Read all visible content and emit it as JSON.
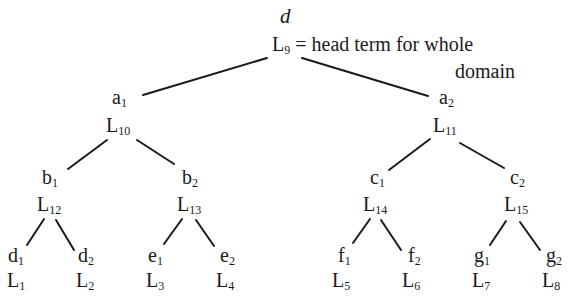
{
  "diagram": {
    "type": "tree",
    "root": {
      "variable": "d",
      "term": "L",
      "term_sub": "9",
      "annotation_line1": "= head term for whole",
      "annotation_line2": "domain"
    },
    "level1": [
      {
        "var": "a",
        "var_sub": "1",
        "term": "L",
        "term_sub": "10"
      },
      {
        "var": "a",
        "var_sub": "2",
        "term": "L",
        "term_sub": "11"
      }
    ],
    "level2": [
      {
        "var": "b",
        "var_sub": "1",
        "term": "L",
        "term_sub": "12"
      },
      {
        "var": "b",
        "var_sub": "2",
        "term": "L",
        "term_sub": "13"
      },
      {
        "var": "c",
        "var_sub": "1",
        "term": "L",
        "term_sub": "14"
      },
      {
        "var": "c",
        "var_sub": "2",
        "term": "L",
        "term_sub": "15"
      }
    ],
    "leaves": [
      {
        "var": "d",
        "var_sub": "1",
        "term": "L",
        "term_sub": "1"
      },
      {
        "var": "d",
        "var_sub": "2",
        "term": "L",
        "term_sub": "2"
      },
      {
        "var": "e",
        "var_sub": "1",
        "term": "L",
        "term_sub": "3"
      },
      {
        "var": "e",
        "var_sub": "2",
        "term": "L",
        "term_sub": "4"
      },
      {
        "var": "f",
        "var_sub": "1",
        "term": "L",
        "term_sub": "5"
      },
      {
        "var": "f",
        "var_sub": "2",
        "term": "L",
        "term_sub": "6"
      },
      {
        "var": "g",
        "var_sub": "1",
        "term": "L",
        "term_sub": "7"
      },
      {
        "var": "g",
        "var_sub": "2",
        "term": "L",
        "term_sub": "8"
      }
    ],
    "colors": {
      "ink": "#1a1a1a",
      "background": "#ffffff"
    }
  }
}
